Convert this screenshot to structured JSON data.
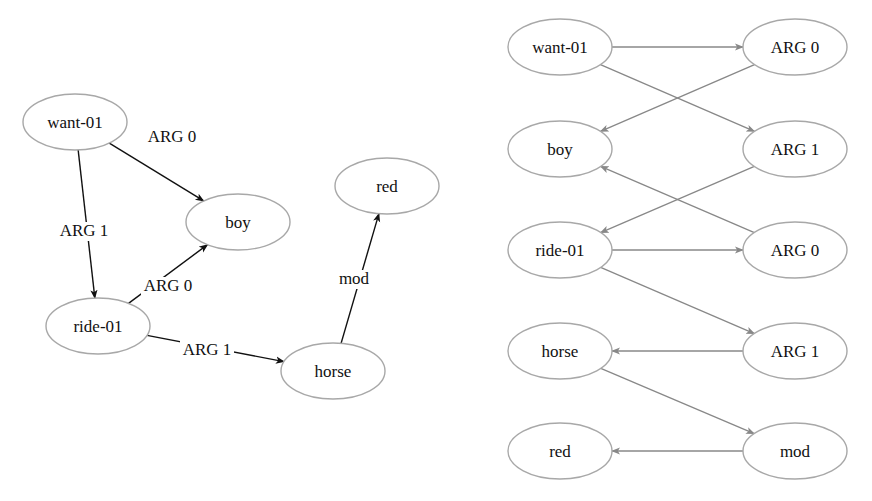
{
  "left_graph": {
    "nodes": [
      {
        "id": "want-01",
        "label": "want-01"
      },
      {
        "id": "boy",
        "label": "boy"
      },
      {
        "id": "ride-01",
        "label": "ride-01"
      },
      {
        "id": "horse",
        "label": "horse"
      },
      {
        "id": "red",
        "label": "red"
      }
    ],
    "edges": [
      {
        "from": "want-01",
        "to": "boy",
        "label": "ARG 0"
      },
      {
        "from": "want-01",
        "to": "ride-01",
        "label": "ARG 1"
      },
      {
        "from": "ride-01",
        "to": "boy",
        "label": "ARG 0"
      },
      {
        "from": "ride-01",
        "to": "horse",
        "label": "ARG 1"
      },
      {
        "from": "horse",
        "to": "red",
        "label": "mod"
      }
    ]
  },
  "right_graph": {
    "concept_nodes": [
      {
        "id": "c-want",
        "label": "want-01"
      },
      {
        "id": "c-boy",
        "label": "boy"
      },
      {
        "id": "c-ride",
        "label": "ride-01"
      },
      {
        "id": "c-horse",
        "label": "horse"
      },
      {
        "id": "c-red",
        "label": "red"
      }
    ],
    "relation_nodes": [
      {
        "id": "r-arg0a",
        "label": "ARG 0"
      },
      {
        "id": "r-arg1a",
        "label": "ARG 1"
      },
      {
        "id": "r-arg0b",
        "label": "ARG 0"
      },
      {
        "id": "r-arg1b",
        "label": "ARG 1"
      },
      {
        "id": "r-mod",
        "label": "mod"
      }
    ],
    "edges": [
      {
        "from": "c-want",
        "to": "r-arg0a"
      },
      {
        "from": "c-want",
        "to": "r-arg1a"
      },
      {
        "from": "r-arg0a",
        "to": "c-boy"
      },
      {
        "from": "r-arg1a",
        "to": "c-ride"
      },
      {
        "from": "c-ride",
        "to": "r-arg0b"
      },
      {
        "from": "c-ride",
        "to": "r-arg1b"
      },
      {
        "from": "r-arg0b",
        "to": "c-boy"
      },
      {
        "from": "r-arg1b",
        "to": "c-horse"
      },
      {
        "from": "c-horse",
        "to": "r-mod"
      },
      {
        "from": "r-mod",
        "to": "c-red"
      }
    ]
  },
  "colors": {
    "node_stroke": "#a8a8a8",
    "left_edge": "#111111",
    "right_edge": "#888888"
  }
}
